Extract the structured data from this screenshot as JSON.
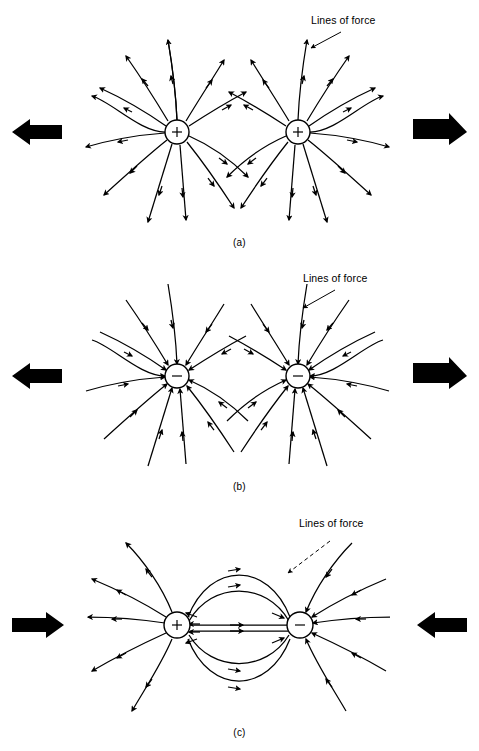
{
  "figure": {
    "background_color": "#ffffff",
    "ink_color": "#000000",
    "width": 479,
    "height": 751
  },
  "panels": [
    {
      "id": "a",
      "caption": "(a)",
      "annotation_label": "Lines of force",
      "leader_style": "solid",
      "charges": [
        {
          "sign": "+",
          "symbol": "+",
          "cx": 177,
          "cy": 132,
          "r": 12
        },
        {
          "sign": "+",
          "symbol": "+",
          "cx": 298,
          "cy": 132,
          "r": 12
        }
      ],
      "interaction": "repulsion",
      "force_arrows": [
        {
          "side": "left",
          "direction": "left",
          "symbol": "←"
        },
        {
          "side": "right",
          "direction": "right",
          "symbol": "→"
        }
      ],
      "field_direction": "outward",
      "lines_per_charge": 12
    },
    {
      "id": "b",
      "caption": "(b)",
      "annotation_label": "Lines of force",
      "leader_style": "solid",
      "charges": [
        {
          "sign": "-",
          "symbol": "−",
          "cx": 177,
          "cy": 118,
          "r": 12
        },
        {
          "sign": "-",
          "symbol": "−",
          "cx": 298,
          "cy": 118,
          "r": 12
        }
      ],
      "interaction": "repulsion",
      "force_arrows": [
        {
          "side": "left",
          "direction": "left",
          "symbol": "←"
        },
        {
          "side": "right",
          "direction": "right",
          "symbol": "→"
        }
      ],
      "field_direction": "inward",
      "lines_per_charge": 12
    },
    {
      "id": "c",
      "caption": "(c)",
      "annotation_label": "Lines of force",
      "leader_style": "dashed",
      "charges": [
        {
          "sign": "+",
          "symbol": "+",
          "cx": 177,
          "cy": 120,
          "r": 13
        },
        {
          "sign": "-",
          "symbol": "−",
          "cx": 300,
          "cy": 120,
          "r": 13
        }
      ],
      "interaction": "attraction",
      "force_arrows": [
        {
          "side": "left",
          "direction": "right",
          "symbol": "→"
        },
        {
          "side": "right",
          "direction": "left",
          "symbol": "←"
        }
      ],
      "field_direction": "plus-to-minus",
      "lines_per_charge": 12,
      "connecting_arcs": 6
    }
  ]
}
